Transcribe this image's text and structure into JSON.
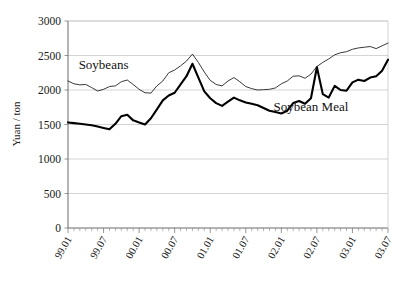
{
  "chart_data": {
    "type": "line",
    "title": "",
    "xlabel": "",
    "ylabel": "Yuan / ton",
    "ylim": [
      0,
      3000
    ],
    "ytick_values": [
      0,
      500,
      1000,
      1500,
      2000,
      2500,
      3000
    ],
    "ytick_labels": [
      "0",
      "500",
      "1000",
      "1500",
      "2000",
      "2500",
      "3000"
    ],
    "grid": true,
    "legend_position": "inline-annotation",
    "xtick_labels": [
      "99.01",
      "99.07",
      "00.01",
      "00.07",
      "01.01",
      "01.07",
      "02.01",
      "02.07",
      "03.01",
      "03.07"
    ],
    "xtick_indices": [
      0,
      6,
      12,
      18,
      24,
      30,
      36,
      42,
      48,
      54
    ],
    "x": [
      "99.01",
      "99.02",
      "99.03",
      "99.04",
      "99.05",
      "99.06",
      "99.07",
      "99.08",
      "99.09",
      "99.10",
      "99.11",
      "99.12",
      "00.01",
      "00.02",
      "00.03",
      "00.04",
      "00.05",
      "00.06",
      "00.07",
      "00.08",
      "00.09",
      "00.10",
      "00.11",
      "00.12",
      "01.01",
      "01.02",
      "01.03",
      "01.04",
      "01.05",
      "01.06",
      "01.07",
      "01.08",
      "01.09",
      "01.10",
      "01.11",
      "01.12",
      "02.01",
      "02.02",
      "02.03",
      "02.04",
      "02.05",
      "02.06",
      "02.07",
      "02.08",
      "02.09",
      "02.10",
      "02.11",
      "02.12",
      "03.01",
      "03.02",
      "03.03",
      "03.04",
      "03.05",
      "03.06",
      "03.07"
    ],
    "series": [
      {
        "name": "Soybeans",
        "style": "thin",
        "color": "#222222",
        "annotation_label": "Soybeans",
        "values": [
          2130,
          2090,
          2075,
          2080,
          2035,
          1985,
          2010,
          2050,
          2060,
          2120,
          2145,
          2080,
          2010,
          1960,
          1955,
          2060,
          2130,
          2250,
          2290,
          2350,
          2420,
          2520,
          2400,
          2260,
          2140,
          2080,
          2060,
          2130,
          2180,
          2120,
          2050,
          2020,
          2000,
          2005,
          2010,
          2030,
          2090,
          2130,
          2200,
          2205,
          2170,
          2230,
          2340,
          2400,
          2450,
          2510,
          2540,
          2555,
          2590,
          2610,
          2620,
          2630,
          2600,
          2640,
          2680
        ]
      },
      {
        "name": "Soybean Meal",
        "style": "thick",
        "color": "#000000",
        "annotation_label": "Soybean Meal",
        "values": [
          1530,
          1520,
          1510,
          1500,
          1490,
          1470,
          1450,
          1430,
          1510,
          1620,
          1640,
          1560,
          1530,
          1500,
          1590,
          1720,
          1850,
          1920,
          1960,
          2080,
          2200,
          2380,
          2180,
          1980,
          1880,
          1810,
          1770,
          1830,
          1890,
          1850,
          1820,
          1800,
          1780,
          1740,
          1700,
          1680,
          1660,
          1700,
          1810,
          1840,
          1800,
          1880,
          2330,
          1940,
          1890,
          2060,
          2000,
          1990,
          2110,
          2150,
          2130,
          2180,
          2200,
          2280,
          2440
        ]
      }
    ],
    "annotations": [
      {
        "text": "Soybeans",
        "x_index": 6,
        "y_value": 2300
      },
      {
        "text": "Soybean Meal",
        "x_index": 41,
        "y_value": 1700
      }
    ]
  }
}
